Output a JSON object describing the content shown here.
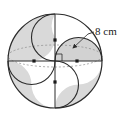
{
  "figure": {
    "label": "8 cm",
    "label_value": "8",
    "label_unit": "cm",
    "colors": {
      "stroke": "#2b2b2b",
      "shade": "#d9d9d9",
      "shade_dark": "#c9c9c9",
      "background": "#ffffff",
      "dot": "#1a1a1a",
      "dotted": "#8a8a8a"
    },
    "geometry": {
      "big_circle": {
        "cx": 55,
        "cy": 61,
        "r": 47,
        "label": "outer-circle"
      },
      "small_radius": 23.5,
      "centers": [
        {
          "name": "center-top",
          "cx": 55,
          "cy": 37.5
        },
        {
          "name": "center-right",
          "cx": 78.5,
          "cy": 61
        },
        {
          "name": "center-bottom",
          "cx": 55,
          "cy": 84.5
        },
        {
          "name": "center-left",
          "cx": 31.5,
          "cy": 61
        }
      ],
      "origin": {
        "name": "origin",
        "cx": 55,
        "cy": 61
      },
      "dots": [
        {
          "name": "dot-top",
          "cx": 55,
          "cy": 40
        },
        {
          "name": "dot-right",
          "cx": 77,
          "cy": 61
        },
        {
          "name": "dot-bottom",
          "cx": 55,
          "cy": 82
        },
        {
          "name": "dot-left",
          "cx": 34,
          "cy": 61
        }
      ],
      "axes": {
        "vertical": {
          "x": 55,
          "y1": 14,
          "y2": 108
        },
        "horizontal": {
          "y": 61,
          "x1": 8,
          "x2": 102
        }
      },
      "perspective_ellipse": {
        "cx": 55,
        "cy": 56,
        "rx": 47,
        "ry": 11
      },
      "leader": {
        "x1": 93,
        "y1": 31,
        "x2": 74,
        "y2": 49
      },
      "right_angle_mark": {
        "x": 55,
        "y": 55,
        "size": 7
      }
    },
    "label_position": {
      "x": 95,
      "y": 31
    }
  }
}
